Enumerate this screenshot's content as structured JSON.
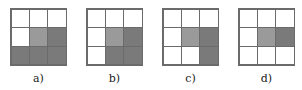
{
  "colors": {
    "white": "#ffffff",
    "light": "#9a9a9a",
    "dark": "#7a7a7a",
    "line": "#6b6b6b"
  },
  "panels": [
    {
      "label": "a)",
      "left": 10,
      "cells": [
        "w",
        "w",
        "w",
        "w",
        "l",
        "d",
        "d",
        "d",
        "d"
      ]
    },
    {
      "label": "b)",
      "left": 86,
      "cells": [
        "w",
        "w",
        "w",
        "w",
        "l",
        "d",
        "w",
        "d",
        "d"
      ]
    },
    {
      "label": "c)",
      "left": 162,
      "cells": [
        "w",
        "w",
        "w",
        "w",
        "l",
        "d",
        "w",
        "w",
        "d"
      ]
    },
    {
      "label": "d)",
      "left": 238,
      "cells": [
        "w",
        "w",
        "w",
        "w",
        "l",
        "d",
        "w",
        "w",
        "w"
      ]
    }
  ]
}
